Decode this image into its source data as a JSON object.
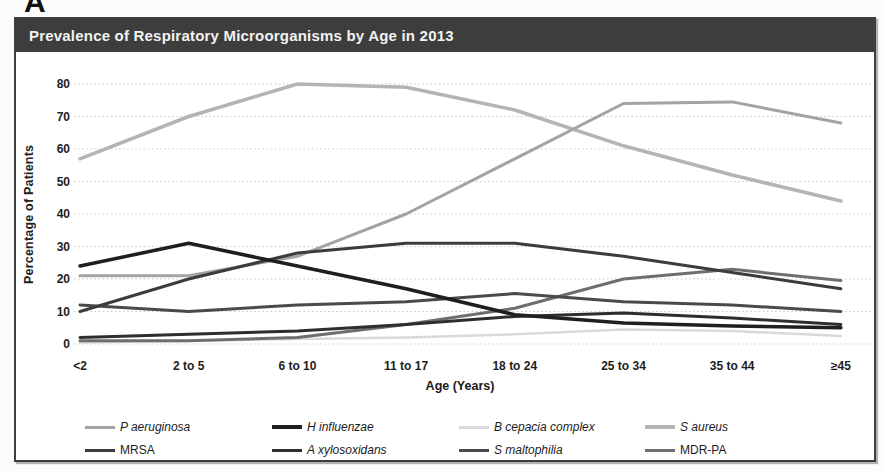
{
  "panel_label": "A",
  "title": "Prevalence of Respiratory Microorganisms by Age in 2013",
  "chart_data": {
    "type": "line",
    "title": "Prevalence of Respiratory Microorganisms by Age in 2013",
    "xlabel": "Age (Years)",
    "ylabel": "Percentage of Patients",
    "categories": [
      "<2",
      "2 to 5",
      "6 to 10",
      "11 to 17",
      "18 to 24",
      "25 to 34",
      "35 to 44",
      "≥45"
    ],
    "yticks": [
      0,
      10,
      20,
      30,
      40,
      50,
      60,
      70,
      80
    ],
    "ylim": [
      0,
      80
    ],
    "grid": true,
    "legend_position": "bottom",
    "legend_rows": 2,
    "series": [
      {
        "name": "P aeruginosa",
        "italic": true,
        "color": "#a3a3a3",
        "width": 3,
        "values": [
          21,
          21,
          27,
          40,
          57,
          74,
          74.5,
          68
        ]
      },
      {
        "name": "H influenzae",
        "italic": true,
        "color": "#1f1f1f",
        "width": 3.5,
        "values": [
          24,
          31,
          24,
          17,
          9,
          6.5,
          5.5,
          5
        ]
      },
      {
        "name": "B cepacia complex",
        "italic": true,
        "color": "#d9d9d9",
        "width": 2.5,
        "values": [
          0.5,
          1,
          1.5,
          2,
          3,
          4.5,
          4,
          2.5
        ]
      },
      {
        "name": "S aureus",
        "italic": true,
        "color": "#b4b4b4",
        "width": 3.5,
        "values": [
          57,
          70,
          80,
          79,
          72,
          61,
          52,
          44
        ]
      },
      {
        "name": "MRSA",
        "italic": false,
        "color": "#3c3c3c",
        "width": 3,
        "values": [
          10,
          20,
          28,
          31,
          31,
          27,
          22,
          17
        ]
      },
      {
        "name": "A xylosoxidans",
        "italic": true,
        "color": "#2e2e2e",
        "width": 3,
        "values": [
          2,
          3,
          4,
          6,
          8.5,
          9.5,
          8,
          6
        ]
      },
      {
        "name": "S maltophilia",
        "italic": true,
        "color": "#4a4a4a",
        "width": 3,
        "values": [
          12,
          10,
          12,
          13,
          15.5,
          13,
          12,
          10
        ]
      },
      {
        "name": "MDR-PA",
        "italic": false,
        "color": "#6e6e6e",
        "width": 3,
        "values": [
          1,
          1,
          2,
          6,
          11,
          20,
          23,
          19.5
        ]
      }
    ]
  }
}
